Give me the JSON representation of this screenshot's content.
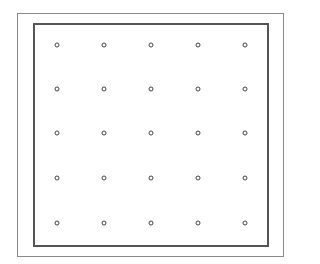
{
  "diagram": {
    "type": "dot-grid",
    "rows": 5,
    "columns": 5,
    "dot_x": [
      57,
      104,
      151,
      198,
      245
    ],
    "dot_y": [
      45,
      89,
      133,
      178,
      223
    ],
    "colors": {
      "outer_frame": "#8a8a8a",
      "inner_frame": "#555555",
      "dot": "#444444"
    }
  }
}
